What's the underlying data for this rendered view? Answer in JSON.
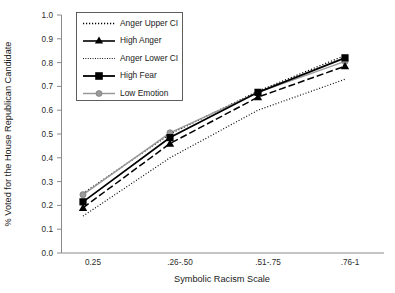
{
  "chart_data": {
    "type": "line",
    "title": "",
    "xlabel": "Symbolic Racism Scale",
    "ylabel": "% Voted for the House Republican Candidate",
    "categories": [
      "0.25",
      ".26-.50",
      ".51-.75",
      ".76-1"
    ],
    "ylim": [
      0.0,
      1.0
    ],
    "ytick_labels": [
      "0.0",
      "0.1",
      "0.2",
      "0.3",
      "0.4",
      "0.5",
      "0.6",
      "0.7",
      "0.8",
      "0.9",
      "1.0"
    ],
    "ytick_values": [
      0.0,
      0.1,
      0.2,
      0.3,
      0.4,
      0.5,
      0.6,
      0.7,
      0.8,
      0.9,
      1.0
    ],
    "grid": false,
    "legend_position": "upper-left-inside",
    "series": [
      {
        "name": "Anger Upper CI",
        "style": "dotted",
        "marker": "none",
        "color": "#000000",
        "values": [
          0.25,
          0.5,
          0.68,
          0.83
        ]
      },
      {
        "name": "High Anger",
        "style": "dashed",
        "marker": "triangle",
        "color": "#000000",
        "values": [
          0.19,
          0.46,
          0.655,
          0.785
        ]
      },
      {
        "name": "Anger Lower CI",
        "style": "dotted",
        "marker": "none",
        "color": "#000000",
        "values": [
          0.155,
          0.4,
          0.6,
          0.73
        ]
      },
      {
        "name": "High Fear",
        "style": "solid",
        "marker": "square",
        "color": "#000000",
        "values": [
          0.215,
          0.485,
          0.675,
          0.82
        ]
      },
      {
        "name": "Low Emotion",
        "style": "solid",
        "marker": "circle",
        "color": "#9a9a9a",
        "values": [
          0.245,
          0.505,
          0.675,
          0.805
        ]
      }
    ]
  },
  "legend": {
    "items": [
      {
        "label": "Anger Upper CI"
      },
      {
        "label": "High Anger"
      },
      {
        "label": "Anger Lower CI"
      },
      {
        "label": "High Fear"
      },
      {
        "label": "Low Emotion"
      }
    ]
  }
}
